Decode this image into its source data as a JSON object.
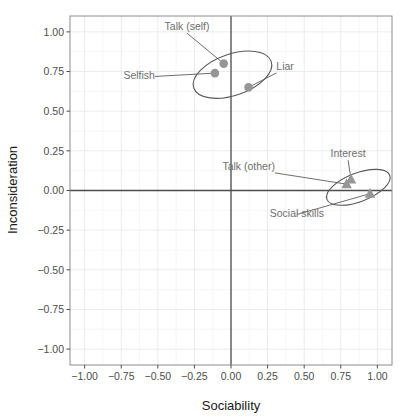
{
  "chart_data": {
    "type": "scatter",
    "title": "",
    "xlabel": "Sociability",
    "ylabel": "Inconsideration",
    "xlim": [
      -1.1,
      1.1
    ],
    "ylim": [
      -1.1,
      1.1
    ],
    "xticks": [
      "-1.00",
      "-0.75",
      "-0.50",
      "-0.25",
      "0.00",
      "0.25",
      "0.50",
      "0.75",
      "1.00"
    ],
    "xtick_values": [
      -1,
      -0.75,
      -0.5,
      -0.25,
      0,
      0.25,
      0.5,
      0.75,
      1
    ],
    "yticks": [
      "1.00",
      "0.75",
      "0.50",
      "0.25",
      "0.00",
      "-0.25",
      "-0.50",
      "-0.75",
      "-1.00"
    ],
    "ytick_values": [
      1,
      0.75,
      0.5,
      0.25,
      0,
      -0.25,
      -0.5,
      -0.75,
      -1
    ],
    "grid": true,
    "legend": "none",
    "reference_lines": {
      "vline_x": 0,
      "hline_y": 0
    },
    "marker_color": "#969696",
    "points": [
      {
        "label": "Talk (self)",
        "x": -0.05,
        "y": 0.8,
        "marker": "circle",
        "cluster": 1
      },
      {
        "label": "Selfish",
        "x": -0.11,
        "y": 0.74,
        "marker": "circle",
        "cluster": 1
      },
      {
        "label": "Liar",
        "x": 0.12,
        "y": 0.65,
        "marker": "circle",
        "cluster": 1
      },
      {
        "label": "Interest",
        "x": 0.82,
        "y": 0.07,
        "marker": "triangle",
        "cluster": 2
      },
      {
        "label": "Talk (other)",
        "x": 0.79,
        "y": 0.04,
        "marker": "triangle",
        "cluster": 2
      },
      {
        "label": "Social skills",
        "x": 0.95,
        "y": -0.02,
        "marker": "triangle",
        "cluster": 2
      }
    ],
    "clusters": [
      {
        "id": 1,
        "cx": 0.01,
        "cy": 0.73,
        "rx": 0.28,
        "ry": 0.13,
        "rotation": -19
      },
      {
        "id": 2,
        "cx": 0.87,
        "cy": 0.02,
        "rx": 0.23,
        "ry": 0.09,
        "rotation": -21
      }
    ],
    "annotations": [
      {
        "text": "Talk (self)",
        "tx": -0.3,
        "ty": 1.01
      },
      {
        "text": "Selfish",
        "tx": -0.52,
        "ty": 0.7
      },
      {
        "text": "Liar",
        "tx": 0.31,
        "ty": 0.76
      },
      {
        "text": "Interest",
        "tx": 0.8,
        "ty": 0.21
      },
      {
        "text": "Talk (other)",
        "tx": 0.3,
        "ty": 0.13
      },
      {
        "text": "Social skills",
        "tx": 0.45,
        "ty": -0.17
      }
    ]
  }
}
